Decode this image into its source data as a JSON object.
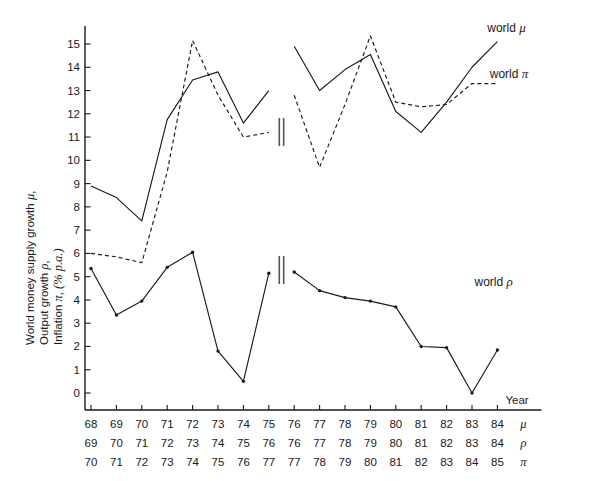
{
  "chart_data": {
    "type": "line",
    "title": "",
    "xlabel": "Year",
    "ylabel_lines": [
      "World money supply growth",
      "Output growth",
      "Inflation"
    ],
    "ylabel_symbols": [
      "μ,",
      "ρ,",
      "π, (% p.a.)"
    ],
    "ylim": [
      0,
      15.8
    ],
    "yticks": [
      0,
      1,
      2,
      3,
      4,
      5,
      6,
      7,
      8,
      9,
      10,
      11,
      12,
      13,
      14,
      15
    ],
    "ytick_labels": [
      "0",
      "1",
      "2",
      "3",
      "4",
      "5",
      "6",
      "7",
      "8",
      "9",
      "10",
      "11",
      "12",
      "13",
      "14",
      "15"
    ],
    "grid": false,
    "legend_position": "inline-annotations",
    "axis_break": true,
    "axis_break_after_index": 7,
    "x_index": [
      0,
      1,
      2,
      3,
      4,
      5,
      6,
      7,
      8,
      9,
      10,
      11,
      12,
      13,
      14,
      15,
      16
    ],
    "x_rows": [
      {
        "symbol": "μ",
        "labels": [
          "68",
          "69",
          "70",
          "71",
          "72",
          "73",
          "74",
          "75",
          "76",
          "77",
          "78",
          "79",
          "80",
          "81",
          "82",
          "83",
          "84"
        ]
      },
      {
        "symbol": "ρ",
        "labels": [
          "69",
          "70",
          "71",
          "72",
          "73",
          "74",
          "75",
          "76",
          "76",
          "77",
          "78",
          "79",
          "80",
          "81",
          "82",
          "83",
          "84"
        ]
      },
      {
        "symbol": "π",
        "labels": [
          "70",
          "71",
          "72",
          "73",
          "74",
          "75",
          "76",
          "77",
          "77",
          "78",
          "79",
          "80",
          "81",
          "82",
          "83",
          "84",
          "85"
        ]
      }
    ],
    "series": [
      {
        "name": "world μ",
        "style": "solid",
        "markers": false,
        "annotation": "world μ",
        "segments": [
          {
            "x": [
              0,
              1,
              2,
              3,
              4,
              5,
              6,
              7
            ],
            "values": [
              8.9,
              8.4,
              7.4,
              11.75,
              13.45,
              13.8,
              11.6,
              13.0
            ]
          },
          {
            "x": [
              8,
              9,
              10,
              11,
              12,
              13,
              14,
              15,
              16
            ],
            "values": [
              14.9,
              13.0,
              13.9,
              14.55,
              12.1,
              11.2,
              12.5,
              14.0,
              15.1
            ]
          }
        ]
      },
      {
        "name": "world π",
        "style": "dashed",
        "markers": false,
        "annotation": "world π",
        "segments": [
          {
            "x": [
              0,
              1,
              2,
              3,
              4,
              5,
              6,
              7
            ],
            "values": [
              6.0,
              5.85,
              5.6,
              9.5,
              15.15,
              12.8,
              11.0,
              11.2
            ]
          },
          {
            "x": [
              8,
              9,
              10,
              11,
              12,
              13,
              14,
              15,
              16
            ],
            "values": [
              12.8,
              9.7,
              12.4,
              15.35,
              12.5,
              12.3,
              12.4,
              13.3,
              13.3
            ]
          }
        ]
      },
      {
        "name": "world ρ",
        "style": "solid",
        "markers": true,
        "annotation": "world ρ",
        "segments": [
          {
            "x": [
              0,
              1,
              2,
              3,
              4,
              5,
              6,
              7
            ],
            "values": [
              5.35,
              3.35,
              3.95,
              5.4,
              6.05,
              1.8,
              0.5,
              5.15
            ]
          },
          {
            "x": [
              8,
              9,
              10,
              11,
              12,
              13,
              14,
              15,
              16
            ],
            "values": [
              5.2,
              4.4,
              4.1,
              3.95,
              3.7,
              2.0,
              1.95,
              0.0,
              1.85
            ]
          }
        ]
      }
    ],
    "annotations": [
      {
        "text": "world μ",
        "x_index": 15.6,
        "value": 15.5
      },
      {
        "text": "world π",
        "x_index": 15.7,
        "value": 13.55
      },
      {
        "text": "world ρ",
        "x_index": 15.1,
        "value": 4.6
      },
      {
        "text": "Year",
        "x_index": 16.75,
        "value": -0.45
      }
    ]
  },
  "figure": {
    "background": "#ffffff",
    "ink_color": "#1a1a1a"
  }
}
